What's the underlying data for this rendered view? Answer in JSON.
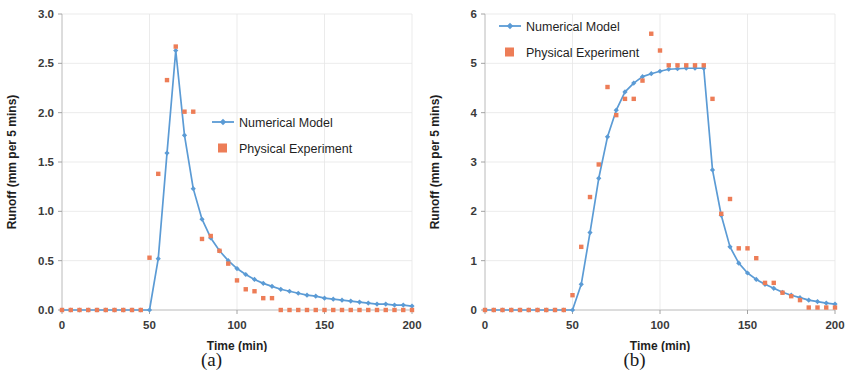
{
  "figure": {
    "panels": [
      {
        "caption": "(a)",
        "xlabel": "Time (min)",
        "ylabel": "Runoff (mm per 5 mins)",
        "legend": [
          {
            "label": "Numerical Model",
            "type": "line-marker",
            "color": "#5B9BD5"
          },
          {
            "label": "Physical Experiment",
            "type": "square",
            "color": "#ED7D57"
          }
        ]
      },
      {
        "caption": "(b)",
        "xlabel": "Time (min)",
        "ylabel": "Runoff (mm per 5 mins)",
        "legend": [
          {
            "label": "Numerical Model",
            "type": "line-marker",
            "color": "#5B9BD5"
          },
          {
            "label": "Physical Experiment",
            "type": "square",
            "color": "#ED7D57"
          }
        ]
      }
    ]
  },
  "chart_data": [
    {
      "type": "line",
      "title": "",
      "panel_label": "(a)",
      "xlabel": "Time (min)",
      "ylabel": "Runoff (mm per 5 mins)",
      "xlim": [
        0,
        200
      ],
      "ylim": [
        0.0,
        3.0
      ],
      "xticks": [
        0,
        50,
        100,
        150,
        200
      ],
      "yticks": [
        0.0,
        0.5,
        1.0,
        1.5,
        2.0,
        2.5,
        3.0
      ],
      "ytick_labels": [
        "0.0",
        "0.5",
        "1.0",
        "1.5",
        "2.0",
        "2.5",
        "3.0"
      ],
      "xtick_labels": [
        "0",
        "50",
        "100",
        "150",
        "200"
      ],
      "grid": true,
      "legend_position": "center-right",
      "series": [
        {
          "name": "Numerical Model",
          "color": "#5B9BD5",
          "marker": "diamond",
          "x": [
            0,
            5,
            10,
            15,
            20,
            25,
            30,
            35,
            40,
            45,
            50,
            55,
            60,
            65,
            70,
            75,
            80,
            85,
            90,
            95,
            100,
            105,
            110,
            115,
            120,
            125,
            130,
            135,
            140,
            145,
            150,
            155,
            160,
            165,
            170,
            175,
            180,
            185,
            190,
            195,
            200
          ],
          "values": [
            0,
            0,
            0,
            0,
            0,
            0,
            0,
            0,
            0,
            0,
            0,
            0.52,
            1.59,
            2.63,
            1.77,
            1.23,
            0.92,
            0.73,
            0.6,
            0.5,
            0.42,
            0.36,
            0.31,
            0.27,
            0.24,
            0.21,
            0.19,
            0.17,
            0.15,
            0.14,
            0.12,
            0.11,
            0.1,
            0.09,
            0.08,
            0.07,
            0.06,
            0.06,
            0.05,
            0.05,
            0.04
          ]
        },
        {
          "name": "Physical Experiment",
          "color": "#ED7D57",
          "marker": "square",
          "x": [
            0,
            5,
            10,
            15,
            20,
            25,
            30,
            35,
            40,
            45,
            50,
            55,
            60,
            65,
            70,
            75,
            80,
            85,
            90,
            95,
            100,
            105,
            110,
            115,
            120,
            125,
            130,
            135,
            140,
            145,
            150,
            155,
            160,
            165,
            170,
            175,
            180,
            185,
            190,
            195,
            200
          ],
          "values": [
            0,
            0,
            0,
            0,
            0,
            0,
            0,
            0,
            0,
            0,
            0.53,
            1.38,
            2.33,
            2.67,
            2.01,
            2.01,
            0.72,
            0.75,
            0.6,
            0.47,
            0.3,
            0.21,
            0.19,
            0.12,
            0.12,
            0,
            0,
            0,
            0,
            0,
            0,
            0,
            0,
            0,
            0,
            0,
            0,
            0,
            0,
            0,
            0
          ]
        }
      ]
    },
    {
      "type": "line",
      "title": "",
      "panel_label": "(b)",
      "xlabel": "Time (min)",
      "ylabel": "Runoff (mm per 5 mins)",
      "xlim": [
        0,
        200
      ],
      "ylim": [
        0,
        6
      ],
      "xticks": [
        0,
        50,
        100,
        150,
        200
      ],
      "yticks": [
        0,
        1,
        2,
        3,
        4,
        5,
        6
      ],
      "ytick_labels": [
        "0",
        "1",
        "2",
        "3",
        "4",
        "5",
        "6"
      ],
      "xtick_labels": [
        "0",
        "50",
        "100",
        "150",
        "200"
      ],
      "grid": true,
      "legend_position": "top-left",
      "series": [
        {
          "name": "Numerical Model",
          "color": "#5B9BD5",
          "marker": "diamond",
          "x": [
            0,
            5,
            10,
            15,
            20,
            25,
            30,
            35,
            40,
            45,
            50,
            55,
            60,
            65,
            70,
            75,
            80,
            85,
            90,
            95,
            100,
            105,
            110,
            115,
            120,
            125,
            130,
            135,
            140,
            145,
            150,
            155,
            160,
            165,
            170,
            175,
            180,
            185,
            190,
            195,
            200
          ],
          "values": [
            0,
            0,
            0,
            0,
            0,
            0,
            0,
            0,
            0,
            0,
            0,
            0.52,
            1.57,
            2.67,
            3.51,
            4.05,
            4.42,
            4.6,
            4.73,
            4.79,
            4.84,
            4.88,
            4.89,
            4.9,
            4.9,
            4.9,
            2.84,
            1.92,
            1.28,
            0.95,
            0.75,
            0.62,
            0.52,
            0.44,
            0.36,
            0.3,
            0.25,
            0.2,
            0.17,
            0.14,
            0.12
          ]
        },
        {
          "name": "Physical Experiment",
          "color": "#ED7D57",
          "marker": "square",
          "x": [
            0,
            5,
            10,
            15,
            20,
            25,
            30,
            35,
            40,
            45,
            50,
            55,
            60,
            65,
            70,
            75,
            80,
            85,
            90,
            95,
            100,
            105,
            110,
            115,
            120,
            125,
            130,
            135,
            140,
            145,
            150,
            155,
            160,
            165,
            170,
            175,
            180,
            185,
            190,
            195,
            200
          ],
          "values": [
            0,
            0,
            0,
            0,
            0,
            0,
            0,
            0,
            0,
            0,
            0.3,
            1.28,
            2.29,
            2.95,
            4.52,
            3.95,
            4.28,
            4.28,
            4.65,
            5.6,
            5.26,
            4.96,
            4.96,
            4.96,
            4.96,
            4.96,
            4.28,
            1.95,
            2.25,
            1.25,
            1.25,
            1.05,
            0.55,
            0.55,
            0.35,
            0.28,
            0.2,
            0.05,
            0.05,
            0.05,
            0.05
          ]
        }
      ]
    }
  ]
}
